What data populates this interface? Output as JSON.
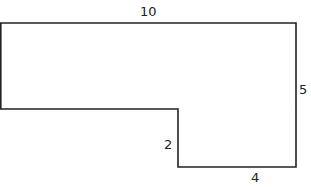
{
  "figure": {
    "question_number_partial": "1.",
    "shape": "L-shaped polygon",
    "labels": {
      "top": "10",
      "right": "5",
      "step": "2",
      "bottom": "4"
    },
    "stroke_color": "#222222"
  }
}
